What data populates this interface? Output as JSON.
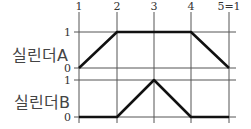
{
  "diagram": {
    "type": "displacement-step diagram",
    "steps": [
      "1",
      "2",
      "3",
      "4",
      "5=1"
    ],
    "cylinders": [
      {
        "name": "실린더A",
        "levels": [
          "1",
          "0"
        ],
        "values": [
          0,
          1,
          1,
          1,
          0
        ]
      },
      {
        "name": "실린더B",
        "levels": [
          "1",
          "0"
        ],
        "values": [
          0,
          0,
          1,
          0,
          0
        ]
      }
    ]
  }
}
